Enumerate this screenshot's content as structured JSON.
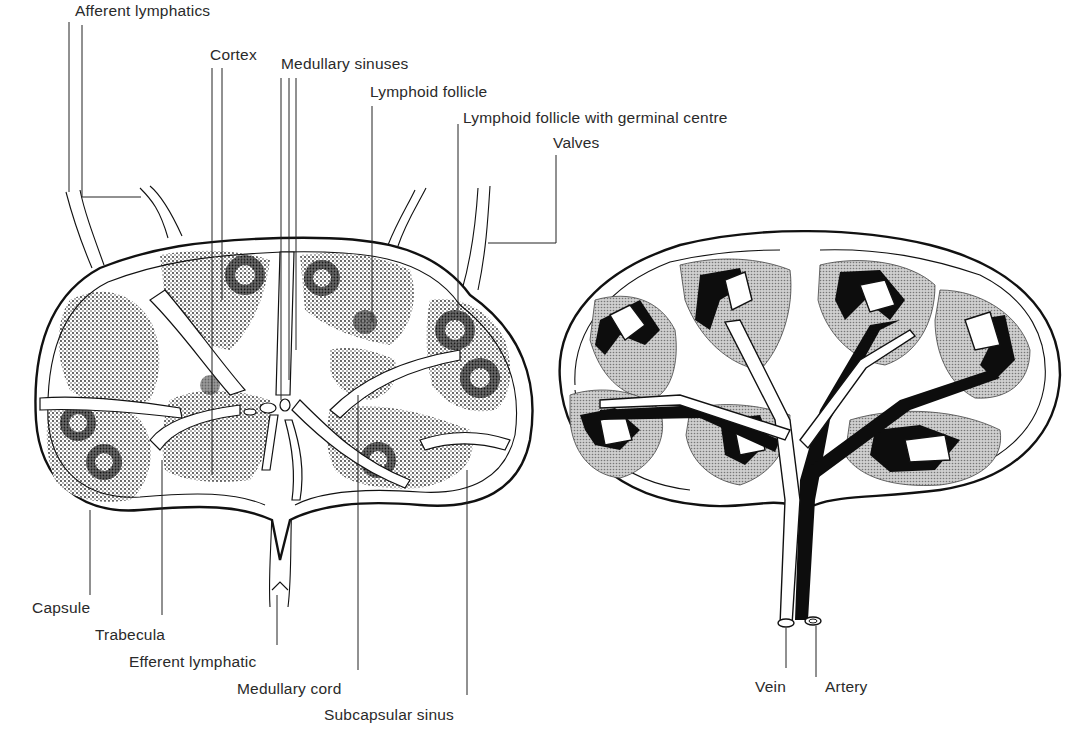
{
  "figure": {
    "left_diagram": {
      "labels": [
        {
          "id": "afferent-lymphatics",
          "text": "Afferent lymphatics",
          "x": 75,
          "y": 2
        },
        {
          "id": "cortex",
          "text": "Cortex",
          "x": 210,
          "y": 46
        },
        {
          "id": "medullary-sinuses",
          "text": "Medullary sinuses",
          "x": 281,
          "y": 54
        },
        {
          "id": "lymphoid-follicle",
          "text": "Lymphoid follicle",
          "x": 370,
          "y": 83
        },
        {
          "id": "lymphoid-follicle-germinal",
          "text": "Lymphoid follicle with germinal centre",
          "x": 463,
          "y": 109
        },
        {
          "id": "valves",
          "text": "Valves",
          "x": 553,
          "y": 134
        },
        {
          "id": "capsule",
          "text": "Capsule",
          "x": 32,
          "y": 599
        },
        {
          "id": "trabecula",
          "text": "Trabecula",
          "x": 95,
          "y": 625
        },
        {
          "id": "efferent-lymphatic",
          "text": "Efferent lymphatic",
          "x": 129,
          "y": 653
        },
        {
          "id": "medullary-cord",
          "text": "Medullary cord",
          "x": 237,
          "y": 680
        },
        {
          "id": "subcapsular-sinus",
          "text": "Subcapsular sinus",
          "x": 324,
          "y": 705
        }
      ]
    },
    "right_diagram": {
      "labels": [
        {
          "id": "vein",
          "text": "Vein",
          "x": 755,
          "y": 677
        },
        {
          "id": "artery",
          "text": "Artery",
          "x": 825,
          "y": 677
        }
      ]
    }
  }
}
